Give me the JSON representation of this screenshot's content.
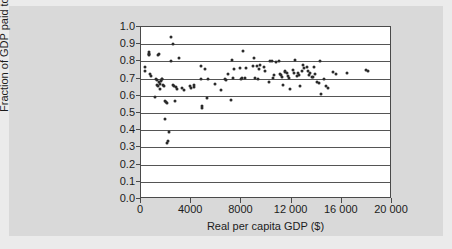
{
  "chart_data": {
    "type": "scatter",
    "title": "",
    "xlabel": "Real per capita GDP ($)",
    "ylabel": "Fraction of GDP paid to labour",
    "xlim": [
      0,
      20000
    ],
    "ylim": [
      0.0,
      1.0
    ],
    "xticks": [
      0,
      4000,
      8000,
      12000,
      16000,
      20000
    ],
    "xtick_labels": [
      "0",
      "4000",
      "8000",
      "12 000",
      "16 000",
      "20 000"
    ],
    "yticks": [
      0.0,
      0.1,
      0.2,
      0.3,
      0.4,
      0.5,
      0.6,
      0.7,
      0.8,
      0.9,
      1.0
    ],
    "ytick_labels": [
      "0.0",
      "0.1",
      "0.2",
      "0.3",
      "0.4",
      "0.5",
      "0.6",
      "0.7",
      "0.8",
      "0.9",
      "1.0"
    ],
    "grid": "horizontal",
    "legend": "none",
    "marker_color": "#2b2b2b",
    "plot_background": "#ffffff",
    "panel_background": "#d9d9d9",
    "figure_background": "#ebebeb",
    "points": [
      [
        300,
        0.765
      ],
      [
        320,
        0.745
      ],
      [
        600,
        0.855
      ],
      [
        620,
        0.845
      ],
      [
        640,
        0.835
      ],
      [
        660,
        0.845
      ],
      [
        700,
        0.725
      ],
      [
        780,
        0.715
      ],
      [
        1150,
        0.592
      ],
      [
        1200,
        0.7
      ],
      [
        1250,
        0.69
      ],
      [
        1300,
        0.662
      ],
      [
        1350,
        0.655
      ],
      [
        1380,
        0.84
      ],
      [
        1420,
        0.845
      ],
      [
        1450,
        0.68
      ],
      [
        1500,
        0.668
      ],
      [
        1550,
        0.64
      ],
      [
        1600,
        0.688
      ],
      [
        1650,
        0.695
      ],
      [
        1700,
        0.7
      ],
      [
        1750,
        0.66
      ],
      [
        1800,
        0.655
      ],
      [
        1900,
        0.466
      ],
      [
        1950,
        0.57
      ],
      [
        2000,
        0.565
      ],
      [
        2050,
        0.56
      ],
      [
        2100,
        0.325
      ],
      [
        2150,
        0.34
      ],
      [
        2200,
        0.39
      ],
      [
        2380,
        0.8
      ],
      [
        2420,
        0.94
      ],
      [
        2520,
        0.9
      ],
      [
        2560,
        0.66
      ],
      [
        2600,
        0.655
      ],
      [
        2700,
        0.57
      ],
      [
        2750,
        0.65
      ],
      [
        2900,
        0.638
      ],
      [
        3050,
        0.82
      ],
      [
        3300,
        0.643
      ],
      [
        3400,
        0.635
      ],
      [
        3900,
        0.655
      ],
      [
        3980,
        0.648
      ],
      [
        4200,
        0.66
      ],
      [
        4250,
        0.652
      ],
      [
        4750,
        0.775
      ],
      [
        4800,
        0.7
      ],
      [
        4850,
        0.528
      ],
      [
        4900,
        0.54
      ],
      [
        5100,
        0.755
      ],
      [
        5250,
        0.588
      ],
      [
        5350,
        0.695
      ],
      [
        5900,
        0.67
      ],
      [
        6350,
        0.636
      ],
      [
        6700,
        0.7
      ],
      [
        6800,
        0.69
      ],
      [
        6900,
        0.727
      ],
      [
        7150,
        0.578
      ],
      [
        7250,
        0.81
      ],
      [
        7300,
        0.705
      ],
      [
        7400,
        0.755
      ],
      [
        7900,
        0.76
      ],
      [
        8000,
        0.7
      ],
      [
        8050,
        0.705
      ],
      [
        8100,
        0.86
      ],
      [
        8250,
        0.705
      ],
      [
        8400,
        0.76
      ],
      [
        8900,
        0.775
      ],
      [
        9000,
        0.82
      ],
      [
        9100,
        0.705
      ],
      [
        9250,
        0.772
      ],
      [
        9300,
        0.7
      ],
      [
        9400,
        0.755
      ],
      [
        9500,
        0.78
      ],
      [
        9800,
        0.765
      ],
      [
        9900,
        0.745
      ],
      [
        10200,
        0.68
      ],
      [
        10300,
        0.8
      ],
      [
        10400,
        0.8
      ],
      [
        10500,
        0.705
      ],
      [
        10600,
        0.72
      ],
      [
        10750,
        0.795
      ],
      [
        11000,
        0.8
      ],
      [
        11050,
        0.725
      ],
      [
        11150,
        0.72
      ],
      [
        11250,
        0.712
      ],
      [
        11350,
        0.662
      ],
      [
        11450,
        0.742
      ],
      [
        11500,
        0.738
      ],
      [
        11600,
        0.73
      ],
      [
        11700,
        0.715
      ],
      [
        11800,
        0.706
      ],
      [
        11900,
        0.64
      ],
      [
        12100,
        0.748
      ],
      [
        12200,
        0.735
      ],
      [
        12300,
        0.81
      ],
      [
        12400,
        0.715
      ],
      [
        12500,
        0.73
      ],
      [
        12600,
        0.72
      ],
      [
        12700,
        0.655
      ],
      [
        12800,
        0.745
      ],
      [
        12900,
        0.78
      ],
      [
        13000,
        0.76
      ],
      [
        13200,
        0.77
      ],
      [
        13300,
        0.745
      ],
      [
        13400,
        0.72
      ],
      [
        13500,
        0.735
      ],
      [
        13600,
        0.712
      ],
      [
        13700,
        0.71
      ],
      [
        13800,
        0.77
      ],
      [
        13900,
        0.725
      ],
      [
        14050,
        0.68
      ],
      [
        14150,
        0.672
      ],
      [
        14250,
        0.8
      ],
      [
        14350,
        0.61
      ],
      [
        14600,
        0.7
      ],
      [
        14750,
        0.655
      ],
      [
        14900,
        0.648
      ],
      [
        15300,
        0.74
      ],
      [
        15500,
        0.725
      ],
      [
        16400,
        0.73
      ],
      [
        17900,
        0.75
      ],
      [
        18100,
        0.745
      ]
    ]
  }
}
